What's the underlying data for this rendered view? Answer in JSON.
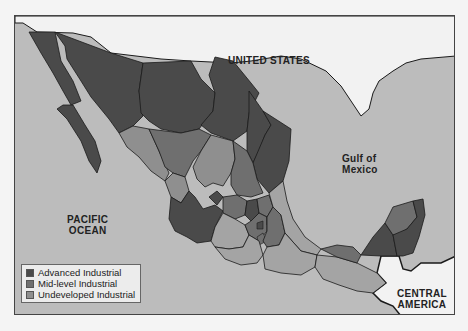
{
  "map": {
    "labels": {
      "united_states": "UNITED STATES",
      "gulf_line1": "Gulf of",
      "gulf_line2": "Mexico",
      "pacific_line1": "PACIFIC",
      "pacific_line2": "OCEAN",
      "central_line1": "CENTRAL",
      "central_line2": "AMERICA"
    },
    "legend": [
      {
        "label": "Advanced Industrial",
        "color": "#4a4a4a"
      },
      {
        "label": "Mid-level Industrial",
        "color": "#6f6f6f"
      },
      {
        "label": "Undeveloped Industrial",
        "color": "#8f8f8f"
      }
    ],
    "colors": {
      "ocean": "#bcbcbc",
      "foreign_land": "#f2f2f2",
      "advanced": "#4a4a4a",
      "mid": "#6f6f6f",
      "undeveloped": "#8f8f8f",
      "border": "#1a1a1a"
    }
  }
}
